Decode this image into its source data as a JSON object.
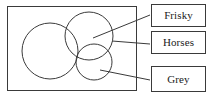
{
  "diagram": {
    "type": "venn",
    "title": "",
    "universe": {
      "name": "universe-rectangle",
      "x": 7,
      "y": 6,
      "width": 130,
      "height": 85
    },
    "sets": [
      {
        "id": "set-large",
        "name": "large-circle",
        "cx": 50,
        "cy": 51,
        "r": 28,
        "label_ref": "frisky"
      },
      {
        "id": "set-medium",
        "name": "medium-circle",
        "cx": 89,
        "cy": 36,
        "r": 24,
        "label_ref": "horses"
      },
      {
        "id": "set-small",
        "name": "small-circle",
        "cx": 94,
        "cy": 62,
        "r": 18,
        "label_ref": "grey"
      }
    ],
    "leader_lines": [
      {
        "name": "leader-line-frisky",
        "x1": 93,
        "y1": 38,
        "x2": 150,
        "y2": 15
      },
      {
        "name": "leader-line-horses",
        "x1": 112,
        "y1": 41,
        "x2": 150,
        "y2": 44
      },
      {
        "name": "leader-line-grey",
        "x1": 100,
        "y1": 70,
        "x2": 150,
        "y2": 80
      }
    ],
    "stroke_color": "#3a3a3a",
    "fill_color": "none",
    "background_color": "#ffffff"
  },
  "labels": {
    "frisky": "Frisky",
    "horses": "Horses",
    "grey": "Grey"
  }
}
